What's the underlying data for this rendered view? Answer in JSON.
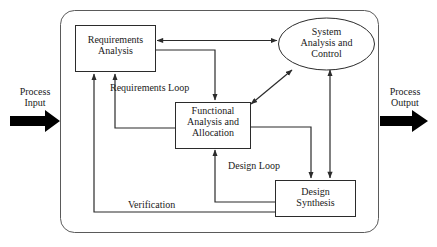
{
  "diagram": {
    "stroke_color": "#2b2b2b",
    "fill_color": "#ffffff",
    "arrow_fill": "#000000",
    "nodes": {
      "requirements_analysis": {
        "label_line1": "Requirements",
        "label_line2": "Analysis",
        "shape": "rectangle"
      },
      "system_analysis": {
        "label_line1": "System",
        "label_line2": "Analysis and",
        "label_line3": "Control",
        "shape": "ellipse"
      },
      "functional_analysis": {
        "label_line1": "Functional",
        "label_line2": "Analysis and",
        "label_line3": "Allocation",
        "shape": "rectangle"
      },
      "design_synthesis": {
        "label_line1": "Design",
        "label_line2": "Synthesis",
        "shape": "rectangle"
      }
    },
    "edge_labels": {
      "requirements_loop": "Requirements Loop",
      "design_loop": "Design Loop",
      "verification": "Verification"
    },
    "io": {
      "input_line1": "Process",
      "input_line2": "Input",
      "output_line1": "Process",
      "output_line2": "Output"
    }
  }
}
